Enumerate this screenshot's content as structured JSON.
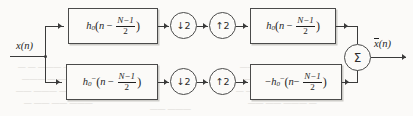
{
  "diagram": {
    "type": "block-diagram",
    "colors": {
      "line": "#3a3a3a",
      "box_border": "#4a4a4a",
      "background": "#fbfaf8",
      "text": "#1f1f1f",
      "bleed_text": "#cdcbc6"
    },
    "input": {
      "label_x": "x",
      "label_args": "(n)"
    },
    "output": {
      "label_x": "x",
      "label_args": "(n)",
      "overbar": true
    },
    "summer": {
      "symbol": "Σ",
      "name": "summation-node"
    },
    "branches": [
      {
        "id": "upper",
        "analysis_filter": {
          "sign": "",
          "h": "h",
          "subscript": "0",
          "superscript": "",
          "open_paren": "(",
          "arg_n": "n",
          "minus": "−",
          "num": "N−1",
          "den": "2",
          "close_paren": ")"
        },
        "downsampler": {
          "arrow": "↓",
          "factor": "2"
        },
        "upsampler": {
          "arrow": "↑",
          "factor": "2"
        },
        "synthesis_filter": {
          "sign": "",
          "h": "h",
          "subscript": "0",
          "superscript": "",
          "open_paren": "(",
          "arg_n": "n",
          "minus": "−",
          "num": "N−1",
          "den": "2",
          "close_paren": ")"
        }
      },
      {
        "id": "lower",
        "analysis_filter": {
          "sign": "",
          "h": "h",
          "subscript": "0",
          "superscript": "−",
          "open_paren": "(",
          "arg_n": "n",
          "minus": "−",
          "num": "N−1",
          "den": "2",
          "close_paren": ")"
        },
        "downsampler": {
          "arrow": "↓",
          "factor": "2"
        },
        "upsampler": {
          "arrow": "↑",
          "factor": "2"
        },
        "synthesis_filter": {
          "sign": "−",
          "h": "h",
          "subscript": "0",
          "superscript": "−",
          "open_paren": "(",
          "arg_n": "n",
          "minus": "−",
          "num": "N−1",
          "den": "2",
          "close_paren": ")"
        }
      }
    ],
    "bleed_through": [
      {
        "text": "— —  ———   — ——",
        "x": 18,
        "y": 62
      },
      {
        "text": "———  — ——  ——",
        "x": 22,
        "y": 74
      },
      {
        "text": "—— ——— —  ———",
        "x": 16,
        "y": 86
      },
      {
        "text": "— ——  —— ———",
        "x": 24,
        "y": 98
      },
      {
        "text": "—— — ———  ——",
        "x": 240,
        "y": 62
      },
      {
        "text": "——— ——  — ——",
        "x": 244,
        "y": 74
      },
      {
        "text": "— ——— ——  ——",
        "x": 236,
        "y": 86
      },
      {
        "text": "—— —— ——— —",
        "x": 248,
        "y": 98
      },
      {
        "text": "—— ———",
        "x": 150,
        "y": 104
      }
    ]
  }
}
